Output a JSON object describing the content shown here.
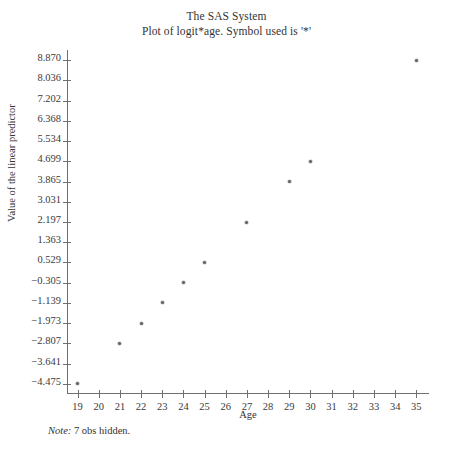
{
  "titles": {
    "line1": "The SAS System",
    "line2": "Plot of logit*age. Symbol used is '*'"
  },
  "footnote": {
    "label": "Note:",
    "text": " 7 obs hidden."
  },
  "chart_data": {
    "type": "scatter",
    "title": "The SAS System",
    "subtitle": "Plot of logit*age. Symbol used is '*'",
    "xlabel": "Age",
    "ylabel": "Value of the linear predictor",
    "xlim": [
      18.5,
      35.6
    ],
    "ylim": [
      -4.892,
      9.287
    ],
    "grid": false,
    "legend": null,
    "marker": "*",
    "marker_color": "#666666",
    "axis_color": "#6f6f6f",
    "xticks": [
      19,
      20,
      21,
      22,
      23,
      24,
      25,
      26,
      27,
      28,
      29,
      30,
      31,
      32,
      33,
      34,
      35
    ],
    "xtick_labels": [
      "19",
      "20",
      "21",
      "22",
      "23",
      "24",
      "25",
      "26",
      "27",
      "28",
      "29",
      "30",
      "31",
      "32",
      "33",
      "34",
      "35"
    ],
    "yticks": [
      8.87,
      8.036,
      7.202,
      6.368,
      5.534,
      4.699,
      3.865,
      3.031,
      2.197,
      1.363,
      0.529,
      -0.305,
      -1.139,
      -1.973,
      -2.807,
      -3.641,
      -4.475
    ],
    "ytick_labels": [
      "8.870",
      "8.036",
      "7.202",
      "6.368",
      "5.534",
      "4.699",
      "3.865",
      "3.031",
      "2.197",
      "1.363",
      "0.529",
      "-0.305",
      "-1.139",
      "-1.973",
      "-2.807",
      "-3.641",
      "-4.475"
    ],
    "x": [
      19,
      21,
      22,
      23,
      24,
      25,
      27,
      29,
      30,
      35
    ],
    "y": [
      -4.475,
      -2.807,
      -1.973,
      -1.139,
      -0.305,
      0.529,
      2.197,
      3.865,
      4.699,
      8.87
    ],
    "points": [
      {
        "x": 19,
        "y": -4.475
      },
      {
        "x": 21,
        "y": -2.807
      },
      {
        "x": 22,
        "y": -1.973
      },
      {
        "x": 23,
        "y": -1.139
      },
      {
        "x": 24,
        "y": -0.305
      },
      {
        "x": 25,
        "y": 0.529
      },
      {
        "x": 27,
        "y": 2.197
      },
      {
        "x": 29,
        "y": 3.865
      },
      {
        "x": 30,
        "y": 4.699
      },
      {
        "x": 35,
        "y": 8.87
      }
    ],
    "annotations": [
      "Note: 7 obs hidden."
    ]
  }
}
